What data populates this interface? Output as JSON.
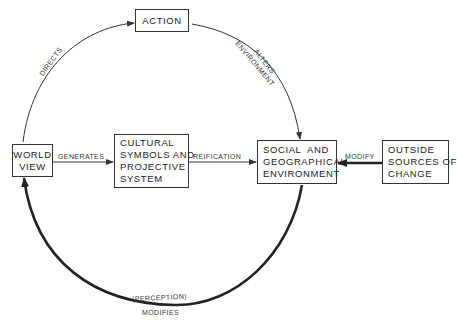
{
  "diagram": {
    "nodes": {
      "action": {
        "lines": [
          "ACTION"
        ]
      },
      "world_view": {
        "lines": [
          "WORLD",
          "VIEW"
        ]
      },
      "cultural": {
        "lines": [
          "CULTURAL",
          "SYMBOLS AND",
          "PROJECTIVE",
          "SYSTEM"
        ]
      },
      "social": {
        "lines": [
          "SOCIAL  AND",
          "GEOGRAPHICAL",
          "ENVIRONMENT"
        ]
      },
      "outside": {
        "lines": [
          "OUTSIDE",
          "SOURCES OF",
          "CHANGE"
        ]
      }
    },
    "edges": {
      "directs": {
        "label": "DIRECTS",
        "from": "WORLD VIEW",
        "to": "ACTION"
      },
      "alters_environment": {
        "label_line1": "ALTERS",
        "label_line2": "ENVIRONMENT",
        "from": "ACTION",
        "to": "SOCIAL AND GEOGRAPHICAL ENVIRONMENT"
      },
      "generates": {
        "label": "GENERATES",
        "from": "WORLD VIEW",
        "to": "CULTURAL SYMBOLS AND PROJECTIVE SYSTEM"
      },
      "reification": {
        "label": "REIFICATION",
        "from": "CULTURAL SYMBOLS AND PROJECTIVE SYSTEM",
        "to": "SOCIAL AND GEOGRAPHICAL ENVIRONMENT"
      },
      "modify": {
        "label": "MODIFY",
        "from": "OUTSIDE SOURCES OF CHANGE",
        "to": "SOCIAL AND GEOGRAPHICAL ENVIRONMENT"
      },
      "perception_modifies": {
        "label_line1": "(PERCEPTION)",
        "label_line2": "MODIFIES",
        "from": "SOCIAL AND GEOGRAPHICAL ENVIRONMENT",
        "to": "WORLD VIEW"
      }
    },
    "colors": {
      "line": "#333333",
      "background": "#ffffff"
    }
  }
}
